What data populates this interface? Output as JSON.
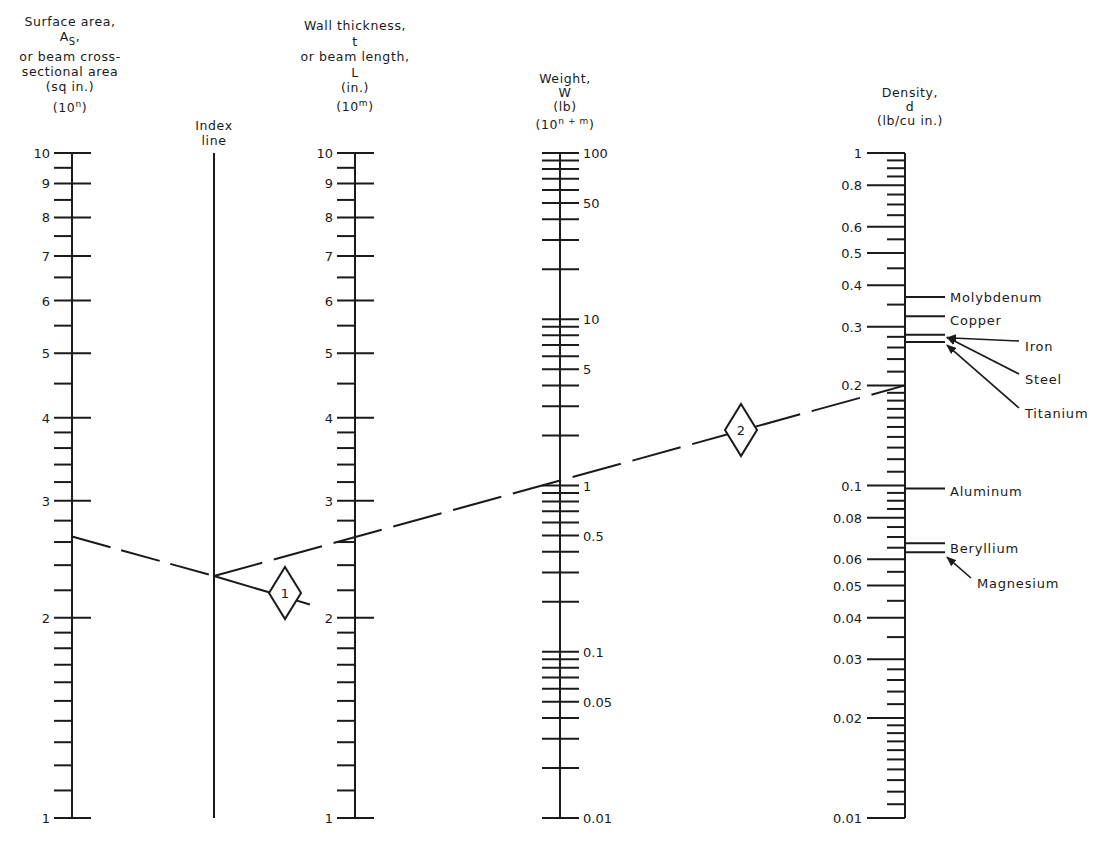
{
  "chart_data": {
    "type": "nomogram",
    "title": "",
    "colors": {
      "ink": "#1a1a1a",
      "background": "#ffffff"
    },
    "headers": {
      "surface_area": [
        "Surface area,",
        "A_S,",
        "or beam cross-",
        "sectional area",
        "(sq in.)",
        "(10^n)"
      ],
      "index_line": [
        "Index",
        "line"
      ],
      "wall_thickness": [
        "Wall thickness,",
        "t",
        "or beam length,",
        "L",
        "(in.)",
        "(10^m)"
      ],
      "weight": [
        "Weight,",
        "W",
        "(lb)",
        "(10^n + m)"
      ],
      "density": [
        "Density,",
        "d",
        "(lb/cu in.)"
      ]
    },
    "axes": [
      {
        "id": "surface_area",
        "x": 72,
        "scale": "log",
        "range": [
          1,
          10
        ],
        "labels_side": "left",
        "major_ticks_both_sides": true,
        "tick_labels": [
          "1",
          "2",
          "3",
          "4",
          "5",
          "6",
          "7",
          "8",
          "9",
          "10"
        ],
        "major_values": [
          1,
          2,
          3,
          4,
          5,
          6,
          7,
          8,
          9,
          10
        ],
        "minor_values": [
          1.1,
          1.2,
          1.3,
          1.4,
          1.5,
          1.6,
          1.7,
          1.8,
          1.9,
          2.2,
          2.4,
          2.6,
          2.8,
          3.2,
          3.4,
          3.6,
          3.8,
          4.5,
          5.5,
          6.5,
          7.5,
          8.5,
          9.5
        ]
      },
      {
        "id": "index_line",
        "x": 214,
        "scale": "none",
        "range": [
          1,
          10
        ],
        "tick_labels": []
      },
      {
        "id": "wall_thickness",
        "x": 355,
        "scale": "log",
        "range": [
          1,
          10
        ],
        "labels_side": "left",
        "major_ticks_both_sides": true,
        "tick_labels": [
          "1",
          "2",
          "3",
          "4",
          "5",
          "6",
          "7",
          "8",
          "9",
          "10"
        ],
        "major_values": [
          1,
          2,
          3,
          4,
          5,
          6,
          7,
          8,
          9,
          10
        ],
        "minor_values": [
          1.1,
          1.2,
          1.3,
          1.4,
          1.5,
          1.6,
          1.7,
          1.8,
          1.9,
          2.2,
          2.4,
          2.6,
          2.8,
          3.2,
          3.4,
          3.6,
          3.8,
          4.5,
          5.5,
          6.5,
          7.5,
          8.5,
          9.5
        ]
      },
      {
        "id": "weight",
        "x": 560,
        "scale": "log",
        "range": [
          0.01,
          100
        ],
        "labels_side": "right",
        "major_ticks_both_sides": true,
        "tick_labels": [
          "0.01",
          "0.05",
          "0.1",
          "0.5",
          "1",
          "5",
          "10",
          "50",
          "100"
        ],
        "labeled_values": [
          0.01,
          0.05,
          0.1,
          0.5,
          1,
          5,
          10,
          50,
          100
        ],
        "tick_values": [
          0.01,
          0.02,
          0.03,
          0.04,
          0.05,
          0.06,
          0.07,
          0.08,
          0.09,
          0.1,
          0.2,
          0.3,
          0.4,
          0.5,
          0.6,
          0.7,
          0.8,
          0.9,
          1,
          2,
          3,
          4,
          5,
          6,
          7,
          8,
          9,
          10,
          20,
          30,
          40,
          50,
          60,
          70,
          80,
          90,
          100
        ]
      },
      {
        "id": "density",
        "x": 905,
        "scale": "log",
        "range": [
          0.01,
          1
        ],
        "labels_side": "left",
        "ticks_side": "left",
        "tick_labels": [
          "0.01",
          "0.02",
          "0.03",
          "0.04",
          "0.05",
          "0.06",
          "0.08",
          "0.1",
          "0.2",
          "0.3",
          "0.4",
          "0.5",
          "0.6",
          "0.8",
          "1"
        ],
        "major_values": [
          0.01,
          0.02,
          0.03,
          0.04,
          0.05,
          0.06,
          0.08,
          0.1,
          0.2,
          0.3,
          0.4,
          0.5,
          0.6,
          0.8,
          1
        ],
        "minor_values": [
          0.011,
          0.012,
          0.013,
          0.014,
          0.015,
          0.016,
          0.017,
          0.018,
          0.019,
          0.022,
          0.024,
          0.026,
          0.028,
          0.035,
          0.045,
          0.055,
          0.065,
          0.07,
          0.075,
          0.085,
          0.09,
          0.095,
          0.11,
          0.12,
          0.13,
          0.14,
          0.15,
          0.16,
          0.17,
          0.18,
          0.19,
          0.22,
          0.24,
          0.26,
          0.28,
          0.35,
          0.45,
          0.55,
          0.65,
          0.7,
          0.75,
          0.85,
          0.9,
          0.95
        ]
      }
    ],
    "materials": [
      {
        "name": "Molybdenum",
        "density": 0.369,
        "label_x": 950,
        "label_y": 298,
        "arrow": false
      },
      {
        "name": "Copper",
        "density": 0.323,
        "label_x": 950,
        "label_y": 321,
        "arrow": false
      },
      {
        "name": "Iron",
        "density": 0.284,
        "label_x": 1025,
        "label_y": 347,
        "arrow": true
      },
      {
        "name": "Steel",
        "density": 0.283,
        "label_x": 1025,
        "label_y": 380,
        "arrow": true
      },
      {
        "name": "Titanium",
        "density": 0.163,
        "tick_density": 0.27,
        "label_x": 1025,
        "label_y": 414,
        "arrow": true
      },
      {
        "name": "Aluminum",
        "density": 0.098,
        "label_x": 950,
        "label_y": 492,
        "arrow": false
      },
      {
        "name": "Beryllium",
        "density": 0.067,
        "label_x": 950,
        "label_y": 549,
        "arrow": false
      },
      {
        "name": "Magnesium",
        "density": 0.063,
        "label_x": 977,
        "label_y": 584,
        "arrow": true
      }
    ],
    "solution_lines": [
      {
        "step": "1",
        "from": {
          "axis": "surface_area",
          "value": 2.65
        },
        "via": {
          "axis": "index_line",
          "y": 576
        },
        "to": {
          "axis": "wall_thickness",
          "value": 2.0
        },
        "marker_position": [
          285,
          593
        ]
      },
      {
        "step": "2",
        "from": {
          "axis": "index_line",
          "y": 576
        },
        "via": {
          "axis": "weight",
          "value": 1.05
        },
        "to": {
          "axis": "density",
          "value": 0.2
        },
        "marker_position": [
          741,
          430
        ]
      }
    ],
    "layout": {
      "top_y": 153,
      "bottom_y": 818,
      "grid": false,
      "legend": "none"
    }
  },
  "headers_text": {
    "sa_1": "Surface area,",
    "sa_2a": "A",
    "sa_2b": "S",
    "sa_2c": ",",
    "sa_3": "or beam cross-",
    "sa_4": "sectional area",
    "sa_5": "(sq in.)",
    "sa_6a": "(10",
    "sa_6b": "n",
    "sa_6c": ")",
    "ix_1": "Index",
    "ix_2": "line",
    "wt_1": "Wall thickness,",
    "wt_2": "t",
    "wt_3": "or beam length,",
    "wt_4": "L",
    "wt_5": "(in.)",
    "wt_6a": "(10",
    "wt_6b": "m",
    "wt_6c": ")",
    "w_1": "Weight,",
    "w_2": "W",
    "w_3": "(lb)",
    "w_4a": "(10",
    "w_4b": "n + m",
    "w_4c": ")",
    "d_1": "Density,",
    "d_2": "d",
    "d_3": "(lb/cu in.)"
  }
}
